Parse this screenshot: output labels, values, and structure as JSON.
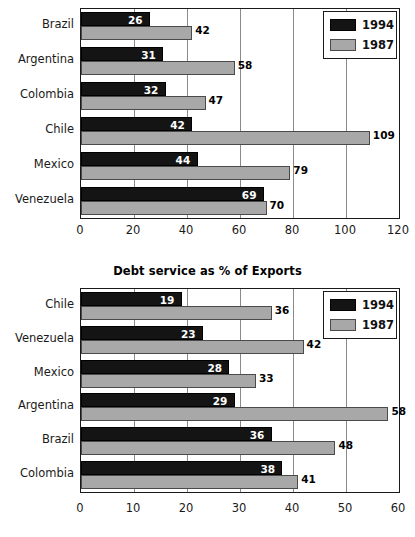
{
  "chart_data": [
    {
      "id": "top",
      "type": "bar",
      "orientation": "horizontal",
      "title": "",
      "xlabel": "",
      "ylabel": "",
      "xlim": [
        0,
        120
      ],
      "xticks": [
        0,
        20,
        40,
        60,
        80,
        100,
        120
      ],
      "grid": true,
      "legend_position": "top-right",
      "categories": [
        "Brazil",
        "Argentina",
        "Colombia",
        "Chile",
        "Mexico",
        "Venezuela"
      ],
      "series": [
        {
          "name": "1994",
          "color": "#141414",
          "values": [
            26,
            31,
            32,
            42,
            44,
            69
          ]
        },
        {
          "name": "1987",
          "color": "#a8a8a8",
          "values": [
            42,
            58,
            47,
            109,
            79,
            70
          ]
        }
      ]
    },
    {
      "id": "bottom",
      "type": "bar",
      "orientation": "horizontal",
      "title": "Debt service as % of Exports",
      "xlabel": "",
      "ylabel": "",
      "xlim": [
        0,
        60
      ],
      "xticks": [
        0,
        10,
        20,
        30,
        40,
        50,
        60
      ],
      "grid": true,
      "legend_position": "top-right",
      "categories": [
        "Chile",
        "Venezuela",
        "Mexico",
        "Argentina",
        "Brazil",
        "Colombia"
      ],
      "series": [
        {
          "name": "1994",
          "color": "#141414",
          "values": [
            19,
            23,
            28,
            29,
            36,
            38
          ]
        },
        {
          "name": "1987",
          "color": "#a8a8a8",
          "values": [
            36,
            42,
            33,
            58,
            48,
            41
          ]
        }
      ]
    }
  ]
}
